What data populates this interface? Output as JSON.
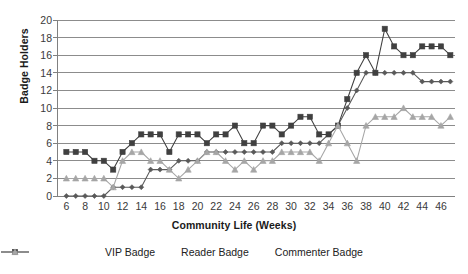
{
  "chart_data": {
    "type": "line",
    "title": "",
    "xlabel": "Community Life (Weeks)",
    "ylabel": "Badge Holders",
    "xlim": [
      5,
      47.5
    ],
    "ylim": [
      0,
      20
    ],
    "ytick_step": 2,
    "xtick_step": 2,
    "grid": true,
    "legend_position": "bottom",
    "x": [
      6,
      7,
      8,
      9,
      10,
      11,
      12,
      13,
      14,
      15,
      16,
      17,
      18,
      19,
      20,
      21,
      22,
      23,
      24,
      25,
      26,
      27,
      28,
      29,
      30,
      31,
      32,
      33,
      34,
      35,
      36,
      37,
      38,
      39,
      40,
      41,
      42,
      43,
      44,
      45,
      46,
      47
    ],
    "xticks": [
      6,
      8,
      10,
      12,
      14,
      16,
      18,
      20,
      22,
      24,
      26,
      28,
      30,
      32,
      34,
      36,
      38,
      40,
      42,
      44,
      46
    ],
    "yticks": [
      0,
      2,
      4,
      6,
      8,
      10,
      12,
      14,
      16,
      18,
      20
    ],
    "series": [
      {
        "name": "VIP Badge",
        "marker": "diamond",
        "color": "#595959",
        "values": [
          0,
          0,
          0,
          0,
          0,
          1,
          1,
          1,
          1,
          3,
          3,
          3,
          4,
          4,
          4,
          5,
          5,
          5,
          5,
          5,
          5,
          5,
          5,
          6,
          6,
          6,
          6,
          6,
          7,
          8,
          10,
          12,
          14,
          14,
          14,
          14,
          14,
          14,
          13,
          13,
          13,
          13
        ]
      },
      {
        "name": "Reader Badge",
        "marker": "square",
        "color": "#404040",
        "values": [
          5,
          5,
          5,
          4,
          4,
          3,
          5,
          6,
          7,
          7,
          7,
          5,
          7,
          7,
          7,
          6,
          7,
          7,
          8,
          6,
          6,
          8,
          8,
          7,
          8,
          9,
          9,
          7,
          7,
          8,
          11,
          14,
          16,
          14,
          19,
          17,
          16,
          16,
          17,
          17,
          17,
          16
        ]
      },
      {
        "name": "Commenter Badge",
        "marker": "triangle",
        "color": "#a6a6a6",
        "values": [
          2,
          2,
          2,
          2,
          2,
          1,
          4,
          5,
          5,
          4,
          4,
          3,
          2,
          3,
          4,
          5,
          5,
          4,
          3,
          4,
          3,
          4,
          4,
          5,
          5,
          5,
          5,
          4,
          6,
          8,
          6,
          4,
          8,
          9,
          9,
          9,
          10,
          9,
          9,
          9,
          8,
          9
        ]
      }
    ]
  },
  "axes": {
    "y_title": "Badge Holders",
    "x_title": "Community Life (Weeks)"
  },
  "legend": {
    "items": [
      {
        "label": "VIP Badge",
        "marker": "diamond-marker-icon",
        "color": "#595959"
      },
      {
        "label": "Reader Badge",
        "marker": "square-marker-icon",
        "color": "#404040"
      },
      {
        "label": "Commenter Badge",
        "marker": "triangle-marker-icon",
        "color": "#a6a6a6"
      }
    ]
  },
  "style": {
    "grid_color": "#808080",
    "axis_color": "#808080",
    "background": "#ffffff",
    "text_color": "#3a3a3a"
  }
}
